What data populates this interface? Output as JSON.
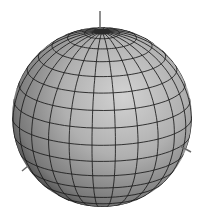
{
  "figure": {
    "type": "3d-sphere-wireframe",
    "colors": {
      "background": "#ffffff",
      "surface_light": "#c8c8c8",
      "surface_mid": "#a8a8a8",
      "surface_dark": "#3a3a3a",
      "grid_line": "#1a1a1a",
      "axis_line": "#6a6a6a"
    },
    "sphere": {
      "cx": 102,
      "cy": 117,
      "r": 90
    },
    "mesh": {
      "latitude_lines": 16,
      "longitude_lines": 24
    },
    "axes": [
      {
        "name": "z-axis",
        "x1": 100,
        "y1": 11,
        "x2": 100,
        "y2": 29
      },
      {
        "name": "x-axis",
        "x1": 22,
        "y1": 171,
        "x2": 28,
        "y2": 166
      },
      {
        "name": "y-axis",
        "x1": 180,
        "y1": 146,
        "x2": 191,
        "y2": 152
      }
    ]
  }
}
